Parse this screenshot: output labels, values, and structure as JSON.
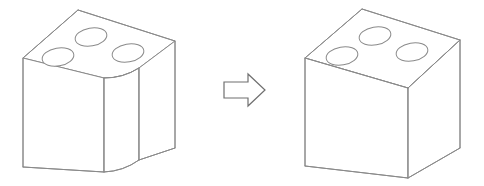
{
  "figure": {
    "background_color": "#ffffff",
    "line_color": "#8a8a8a",
    "arrow_stroke_color": "#6f6f6f",
    "width": 484,
    "height": 186
  },
  "shapes": {
    "before": {
      "name": "rounded-corner-block",
      "label": "Block with filleted vertical corner",
      "hole_count": 3,
      "holes": [
        {
          "cx": 91,
          "cy": 37,
          "rx": 16,
          "ry": 9,
          "name": "hole-top"
        },
        {
          "cx": 58,
          "cy": 57,
          "rx": 16,
          "ry": 9,
          "name": "hole-left"
        },
        {
          "cx": 128,
          "cy": 53,
          "rx": 16,
          "ry": 9,
          "name": "hole-right"
        }
      ],
      "top_face": {
        "apex_top": [
          78,
          10
        ],
        "corner_left": [
          23,
          58
        ],
        "corner_right": [
          175,
          41
        ],
        "fillet_start": [
          104,
          78
        ],
        "fillet_end": [
          139,
          68
        ]
      },
      "body": {
        "left_edge": [
          [
            23,
            58
          ],
          [
            23,
            167
          ]
        ],
        "fillet_left_edge": [
          [
            104,
            78
          ],
          [
            104,
            172
          ]
        ],
        "fillet_right_edge": [
          [
            139,
            68
          ],
          [
            139,
            160
          ]
        ],
        "right_edge": [
          [
            175,
            41
          ],
          [
            175,
            148
          ]
        ],
        "bottom_left": [
          [
            23,
            167
          ],
          [
            104,
            172
          ]
        ],
        "bottom_right": [
          [
            139,
            160
          ],
          [
            175,
            148
          ]
        ]
      }
    },
    "after": {
      "name": "sharp-corner-cube",
      "label": "Cube with sharp vertical corner",
      "hole_count": 3,
      "holes": [
        {
          "cx": 375,
          "cy": 36,
          "rx": 16,
          "ry": 9,
          "name": "hole-top"
        },
        {
          "cx": 342,
          "cy": 56,
          "rx": 16,
          "ry": 9,
          "name": "hole-left"
        },
        {
          "cx": 412,
          "cy": 52,
          "rx": 16,
          "ry": 9,
          "name": "hole-right"
        }
      ],
      "top_face": {
        "apex_top": [
          362,
          9
        ],
        "corner_left": [
          305,
          58
        ],
        "corner_right": [
          460,
          40
        ],
        "apex_front": [
          408,
          88
        ]
      },
      "body": {
        "left_edge": [
          [
            305,
            58
          ],
          [
            305,
            166
          ]
        ],
        "front_edge": [
          [
            408,
            88
          ],
          [
            408,
            178
          ]
        ],
        "right_edge": [
          [
            460,
            40
          ],
          [
            460,
            148
          ]
        ],
        "bottom_left": [
          [
            305,
            166
          ],
          [
            408,
            178
          ]
        ],
        "bottom_right": [
          [
            408,
            178
          ],
          [
            460,
            148
          ]
        ]
      }
    }
  },
  "arrow": {
    "name": "transformation-arrow",
    "direction": "right",
    "points": "224,82 248,82 248,74 265,90 248,106 248,98 224,98",
    "tail_x": 224,
    "tip_x": 265,
    "center_y": 90
  },
  "labels": {
    "before_caption": "",
    "after_caption": "",
    "arrow_caption": ""
  }
}
